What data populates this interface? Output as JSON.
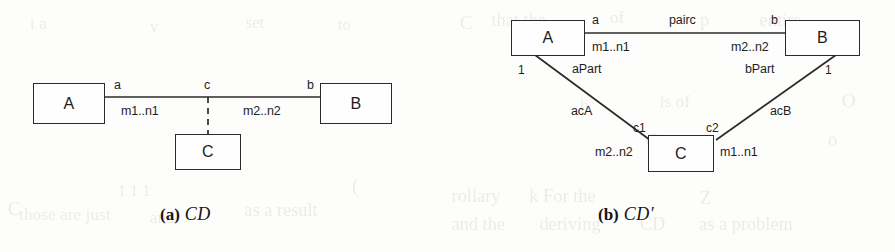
{
  "page": {
    "background_color": "#fdfdfc",
    "ink_color": "#1d1d1d"
  },
  "figures": [
    {
      "id": "a",
      "caption_tag": "(a)",
      "caption_name": "CD",
      "classes": [
        {
          "key": "A",
          "label": "A"
        },
        {
          "key": "B",
          "label": "B"
        },
        {
          "key": "C",
          "label": "C"
        }
      ],
      "role_labels": {
        "a_end": "a",
        "c_end": "c",
        "b_end": "b"
      },
      "multiplicities": {
        "a_side": "m1..n1",
        "b_side": "m2..n2"
      }
    },
    {
      "id": "b",
      "caption_tag": "(b)",
      "caption_name": "CD′",
      "classes": [
        {
          "key": "A",
          "label": "A"
        },
        {
          "key": "B",
          "label": "B"
        },
        {
          "key": "C",
          "label": "C"
        }
      ],
      "top_association": {
        "name": "pairc",
        "a_end": "a",
        "b_end": "b",
        "a_mult": "m1..n1",
        "b_mult": "m2..n2"
      },
      "left_association": {
        "name": "acA",
        "a_end_role": "aPart",
        "a_end_mult": "1",
        "c_end": "c1",
        "c_end_mult": "m2..n2"
      },
      "right_association": {
        "name": "acB",
        "b_end_role": "bPart",
        "b_end_mult": "1",
        "c_end": "c2",
        "c_end_mult": "m1..n1"
      }
    }
  ],
  "ghost_text": [
    {
      "text": "C",
      "x": 8,
      "y": 198,
      "size": 19
    },
    {
      "text": "those are just",
      "x": 20,
      "y": 205,
      "size": 17
    },
    {
      "text": "1 1 1",
      "x": 118,
      "y": 182,
      "size": 16
    },
    {
      "text": "and",
      "x": 150,
      "y": 208,
      "size": 17
    },
    {
      "text": "as a result",
      "x": 245,
      "y": 200,
      "size": 18
    },
    {
      "text": "i a",
      "x": 30,
      "y": 14,
      "size": 17
    },
    {
      "text": "v",
      "x": 150,
      "y": 18,
      "size": 16
    },
    {
      "text": "set",
      "x": 246,
      "y": 14,
      "size": 16
    },
    {
      "text": "to",
      "x": 338,
      "y": 16,
      "size": 16
    },
    {
      "text": "(",
      "x": 352,
      "y": 175,
      "size": 19
    },
    {
      "text": "C",
      "x": 460,
      "y": 12,
      "size": 19
    },
    {
      "text": "that the",
      "x": 492,
      "y": 10,
      "size": 18
    },
    {
      "text": "of",
      "x": 610,
      "y": 8,
      "size": 17
    },
    {
      "text": "p",
      "x": 700,
      "y": 10,
      "size": 18
    },
    {
      "text": "entire",
      "x": 760,
      "y": 10,
      "size": 18
    },
    {
      "text": "is of",
      "x": 660,
      "y": 92,
      "size": 17
    },
    {
      "text": "h",
      "x": 580,
      "y": 96,
      "size": 17
    },
    {
      "text": "O",
      "x": 842,
      "y": 90,
      "size": 19
    },
    {
      "text": "C",
      "x": 646,
      "y": 130,
      "size": 19
    },
    {
      "text": "o",
      "x": 828,
      "y": 130,
      "size": 18
    },
    {
      "text": "rollary",
      "x": 452,
      "y": 186,
      "size": 18
    },
    {
      "text": "k For the",
      "x": 530,
      "y": 186,
      "size": 18
    },
    {
      "text": "Z",
      "x": 700,
      "y": 188,
      "size": 18
    },
    {
      "text": "and the",
      "x": 452,
      "y": 214,
      "size": 18
    },
    {
      "text": "deriving",
      "x": 540,
      "y": 214,
      "size": 18
    },
    {
      "text": "CD",
      "x": 640,
      "y": 214,
      "size": 18
    },
    {
      "text": "as a problem",
      "x": 700,
      "y": 214,
      "size": 18
    }
  ]
}
